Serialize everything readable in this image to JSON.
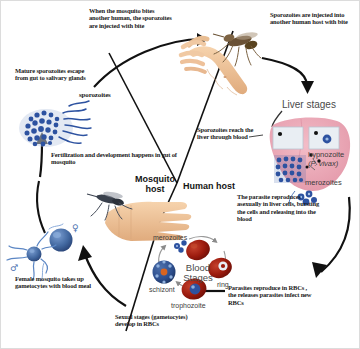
{
  "diagram": {
    "hosts": [
      {
        "name": "mosquito-host",
        "label": "Mosquito host"
      },
      {
        "name": "human-host",
        "label": "Human host"
      }
    ],
    "annotations": [
      {
        "name": "annotation-mosquito-bites-human",
        "text": "When the mosquito bites another human, the sporozoites are injected with bite"
      },
      {
        "name": "annotation-sporozoites-injected",
        "text": "Sporozoites are injected into another human host with bite"
      },
      {
        "name": "annotation-mature-sporozoites",
        "text": "Mature sporozoites escape from gut to salivary glands"
      },
      {
        "name": "annotation-fertilization",
        "text": "Fertilization and development happens in gut of mosquito"
      },
      {
        "name": "annotation-sporozoites-reach-liver",
        "text": "Sporozoites reach the liver through blood"
      },
      {
        "name": "annotation-parasite-reproduces-liver",
        "text": "The parasite reproduces asexually in liver cells, bursting the cells and releasing into the blood"
      },
      {
        "name": "annotation-parasites-reproduce-rbc",
        "text": "Parasites reproduce in RBCs , the releases parasites infect new RBCs"
      },
      {
        "name": "annotation-female-mosquito-gametocytes",
        "text": "Female mosquito takes up gametocytes with blood meal"
      },
      {
        "name": "annotation-sexual-stages",
        "text": "Sexual stages (gametocytes) develop in RBCs"
      }
    ],
    "stage_labels": {
      "liver_stages": "Liver stages",
      "blood_stages": "Blood Stages",
      "sporozoites": "sporozoites",
      "hypnozoite": "hypnozoite",
      "hypnozoite_species": "(P. vivax)",
      "merozoites_liver": "merozoites",
      "merozoites_blood": "merozoites",
      "schizont": "schizont",
      "ring": "ring",
      "trophozoite": "trophozoite",
      "female_symbol": "♀",
      "male_symbol": "♂"
    },
    "colors": {
      "parasite_blue": "#2d52a0",
      "liver_pink": "#eeaab8",
      "rbc_red": "#a01c10",
      "skin": "#f0c294",
      "arrow_black": "#111111",
      "thin_arrow_gray": "#8a8a8a",
      "stage_text": "#2b2b2b"
    }
  }
}
